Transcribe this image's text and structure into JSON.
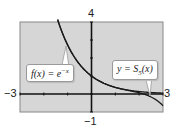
{
  "chart_data": {
    "type": "line",
    "title": "",
    "xlabel": "",
    "ylabel": "",
    "xlim": [
      -3,
      3
    ],
    "ylim": [
      -1,
      4
    ],
    "tick_labels": {
      "x_min": "-3",
      "x_max": "3",
      "y_max": "4",
      "y_min": "-1"
    },
    "grid": false,
    "series": [
      {
        "name": "f(x) = e^(-x)",
        "function": "exp(-x)"
      },
      {
        "name": "y = S_5(x)",
        "function": "1 - x + x^2/2 - x^3/6 + x^4/24 - x^5/120"
      }
    ],
    "annotations": [
      {
        "text": "f(x) = e^{-x}",
        "points_to": "f(x) = e^(-x)"
      },
      {
        "text": "y = S_5(x)",
        "points_to": "y = S_5(x)"
      }
    ],
    "colors": {
      "background": "#d6d6d6",
      "curve": "#1a1a1a"
    }
  },
  "labels": {
    "y_max": "4",
    "y_min": "−1",
    "x_min": "−3",
    "x_max": "3",
    "f_label": "f(x) = e",
    "f_exp": "−x",
    "s_label_pre": "y = S",
    "s_sub": "5",
    "s_label_post": "(x)"
  }
}
